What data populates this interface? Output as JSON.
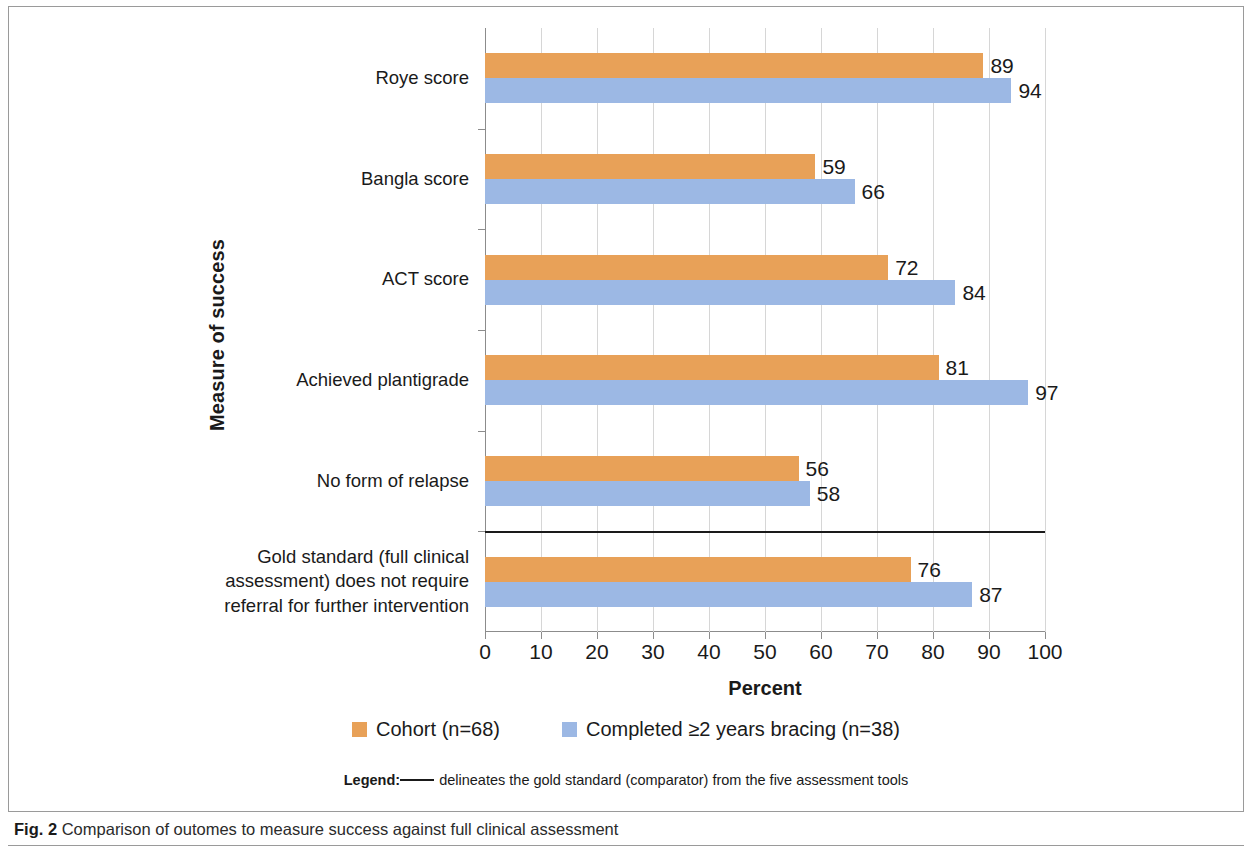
{
  "chart_data": {
    "type": "bar",
    "orientation": "horizontal",
    "title": "",
    "xlabel": "Percent",
    "ylabel": "Measure of success",
    "xlim": [
      0,
      100
    ],
    "xticks": [
      0,
      10,
      20,
      30,
      40,
      50,
      60,
      70,
      80,
      90,
      100
    ],
    "grid": true,
    "legend_position": "bottom",
    "categories": [
      "Roye score",
      "Bangla score",
      "ACT score",
      "Achieved plantigrade",
      "No form of relapse",
      "Gold standard (full clinical\nassessment) does not require\nreferral for further intervention"
    ],
    "series": [
      {
        "name": "Cohort (n=68)",
        "color": "#e8a158",
        "values": [
          89,
          59,
          72,
          81,
          56,
          76
        ]
      },
      {
        "name": "Completed ≥2 years bracing (n=38)",
        "color": "#9cb8e4",
        "values": [
          94,
          66,
          84,
          97,
          58,
          87
        ]
      }
    ],
    "annotations": [
      {
        "type": "divider-line",
        "description": "black horizontal rule delineating the gold standard comparator from the five assessment tools",
        "after_category_index": 4
      }
    ]
  },
  "axis": {
    "x_title": "Percent",
    "y_title": "Measure of success",
    "x_tick_labels": [
      "0",
      "10",
      "20",
      "30",
      "40",
      "50",
      "60",
      "70",
      "80",
      "90",
      "100"
    ]
  },
  "legend": {
    "entries": [
      {
        "label": "Cohort (n=68)",
        "color": "#e8a158"
      },
      {
        "label": "Completed ≥2 years bracing (n=38)",
        "color": "#9cb8e4"
      }
    ],
    "note_label": "Legend:",
    "note_text": "delineates the gold standard  (comparator) from the five assessment tools"
  },
  "caption": {
    "label": "Fig. 2",
    "text": "Comparison of outomes to measure success against full clinical assessment"
  },
  "bar_value_labels": {
    "roye": {
      "cohort": "89",
      "braced": "94"
    },
    "bangla": {
      "cohort": "59",
      "braced": "66"
    },
    "act": {
      "cohort": "72",
      "braced": "84"
    },
    "plantigrade": {
      "cohort": "81",
      "braced": "97"
    },
    "relapse": {
      "cohort": "56",
      "braced": "58"
    },
    "gold": {
      "cohort": "76",
      "braced": "87"
    }
  }
}
